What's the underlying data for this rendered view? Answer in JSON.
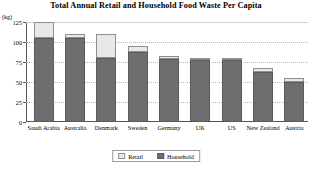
{
  "chart_data": {
    "type": "bar",
    "title": "Total Annual Retail and Household Food Waste Per Capita",
    "xlabel": "",
    "ylabel": "(kg)",
    "ylim": [
      0,
      125
    ],
    "yticks": [
      0,
      25,
      50,
      75,
      100,
      125
    ],
    "grid": true,
    "legend_position": "bottom",
    "stacked": true,
    "categories": [
      "Saudi Arabia",
      "Australia",
      "Denmark",
      "Sweden",
      "Germany",
      "UK",
      "US",
      "New Zealand",
      "Austria"
    ],
    "series": [
      {
        "name": "Household",
        "color": "#6e6e6e",
        "values": [
          105,
          105,
          80,
          88,
          79,
          77,
          77,
          63,
          50
        ]
      },
      {
        "name": "Retail",
        "color": "#e8e8e8",
        "values": [
          20,
          5,
          30,
          7,
          3,
          3,
          3,
          5,
          5
        ]
      }
    ],
    "totals": [
      125,
      110,
      110,
      95,
      82,
      80,
      80,
      68,
      55
    ]
  },
  "legend": {
    "items": [
      {
        "label": "Retail",
        "swatch": "retail"
      },
      {
        "label": "Household",
        "swatch": "household"
      }
    ]
  }
}
